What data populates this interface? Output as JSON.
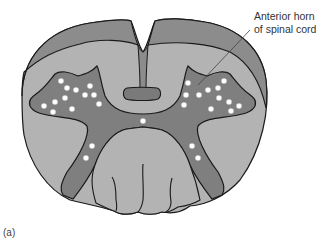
{
  "figure": {
    "panel_label": "(a)",
    "annotation": {
      "line1": "Anterior horn",
      "line2": "of spinal cord",
      "target": "anterior horn (right)"
    },
    "colors": {
      "background": "#ffffff",
      "outer_white_matter_dark": "#8c8c8c",
      "white_matter_light": "#b3b3b3",
      "gray_matter": "#7f7f7f",
      "central_bar": "#7a7a7a",
      "neuron_dots": "#ffffff",
      "outline": "#1a1a1a",
      "leader_line": "#444444",
      "text": "#333333"
    },
    "structures": [
      "posterior white columns (darker band)",
      "lateral white matter",
      "gray matter (butterfly shape)",
      "central canal region",
      "anterior median fissure / ventral columns",
      "motor neuron cell bodies (white dots)"
    ],
    "neuron_count_left": 13,
    "neuron_count_right": 13,
    "neuron_count_center": 1,
    "neuron_count_ventral_left": 2,
    "neuron_count_ventral_right": 2
  }
}
